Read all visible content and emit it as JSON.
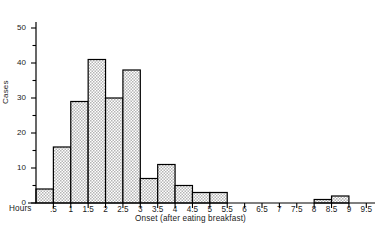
{
  "chart_data": {
    "type": "bar",
    "title": "",
    "subtitle": "",
    "xlabel": "Onset (after eating breakfast)",
    "ylabel": "Cases",
    "x_unit_label": "Hours",
    "bin_width": 0.5,
    "xlim": [
      0,
      9.75
    ],
    "ylim": [
      0,
      50
    ],
    "grid": false,
    "legend": null,
    "y_major_tick_step": 10,
    "y_minor_tick_step": 5,
    "ytick_labels": [
      "0",
      "10",
      "20",
      "30",
      "40",
      "50"
    ],
    "ytick_values": [
      0,
      10,
      20,
      30,
      40,
      50
    ],
    "xtick_labels": [
      ".5",
      "1",
      "1.5",
      "2",
      "2.5",
      "3",
      "3.5",
      "4",
      "4.5",
      "5",
      "5.5",
      "6",
      "6.5",
      "7",
      "7.5",
      "8",
      "8.5",
      "9",
      "9.5"
    ],
    "xtick_values": [
      0.5,
      1,
      1.5,
      2,
      2.5,
      3,
      3.5,
      4,
      4.5,
      5,
      5.5,
      6,
      6.5,
      7,
      7.5,
      8,
      8.5,
      9,
      9.5
    ],
    "categories": [
      "0-0.5",
      "0.5-1",
      "1-1.5",
      "1.5-2",
      "2-2.5",
      "2.5-3",
      "3-3.5",
      "3.5-4",
      "4-4.5",
      "4.5-5",
      "5-5.5",
      "5.5-6",
      "6-6.5",
      "6.5-7",
      "7-7.5",
      "7.5-8",
      "8-8.5",
      "8.5-9",
      "9-9.5"
    ],
    "bin_starts": [
      0,
      0.5,
      1,
      1.5,
      2,
      2.5,
      3,
      3.5,
      4,
      4.5,
      5,
      5.5,
      6,
      6.5,
      7,
      7.5,
      8,
      8.5,
      9
    ],
    "values": [
      4,
      16,
      29,
      41,
      30,
      38,
      7,
      11,
      5,
      3,
      3,
      0,
      0,
      0,
      0,
      0,
      1,
      2,
      0
    ],
    "bar_fill_color": "#d0d0d0",
    "bar_edge_color": "#000000",
    "axis_color": "#000000",
    "background_color": "#ffffff"
  }
}
